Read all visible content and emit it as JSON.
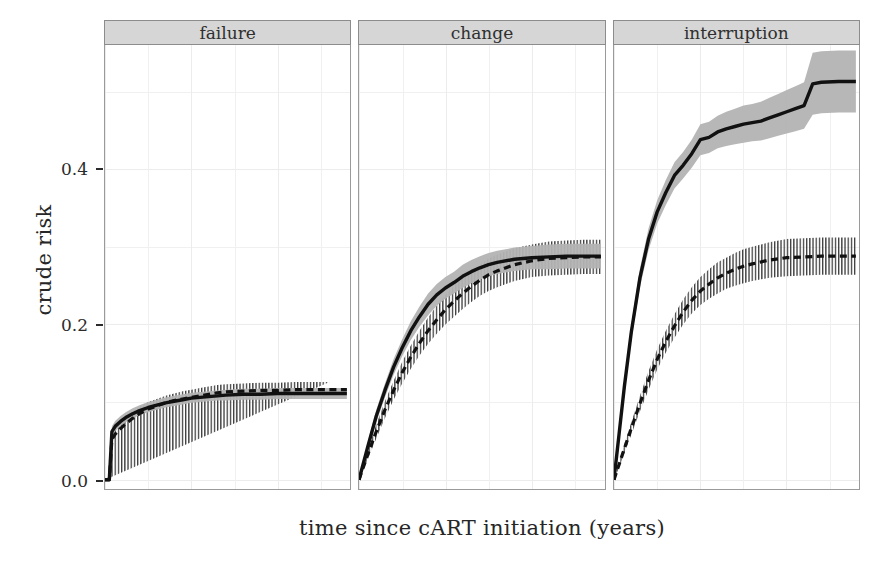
{
  "chart_data": {
    "type": "line",
    "title": "",
    "xlabel": "time since cART initiation (years)",
    "ylabel": "crude risk",
    "xlim": [
      0,
      14.2
    ],
    "ylim": [
      -0.012,
      0.56
    ],
    "xticks": [
      0,
      5,
      10
    ],
    "xticklabels": [
      "0",
      "5",
      "10"
    ],
    "yticks": [
      0.0,
      0.2,
      0.4
    ],
    "yticklabels": [
      "0.0",
      "0.2",
      "0.4"
    ],
    "grid": true,
    "legend": "none",
    "facet_variable": "outcome",
    "facets": [
      "failure",
      "change",
      "interruption"
    ],
    "series": [
      {
        "name": "solid-estimate",
        "style": "solid",
        "facet": "failure",
        "x": [
          0,
          0.25,
          0.4,
          0.6,
          0.9,
          1.2,
          1.6,
          2.0,
          2.5,
          3.0,
          3.5,
          4.0,
          4.5,
          5.0,
          5.5,
          6.0,
          6.5,
          7.0,
          8.0,
          9.0,
          10.0,
          11.0,
          12.0,
          13.0,
          14.0
        ],
        "y": [
          0.0,
          0.0,
          0.062,
          0.069,
          0.075,
          0.08,
          0.085,
          0.089,
          0.093,
          0.096,
          0.099,
          0.101,
          0.103,
          0.105,
          0.106,
          0.107,
          0.108,
          0.109,
          0.11,
          0.11,
          0.111,
          0.111,
          0.111,
          0.111,
          0.111
        ],
        "lower": [
          0.0,
          0.0,
          0.056,
          0.063,
          0.069,
          0.074,
          0.079,
          0.083,
          0.087,
          0.09,
          0.093,
          0.095,
          0.097,
          0.099,
          0.1,
          0.101,
          0.102,
          0.102,
          0.103,
          0.103,
          0.104,
          0.104,
          0.104,
          0.104,
          0.104
        ],
        "upper": [
          0.0,
          0.0,
          0.069,
          0.076,
          0.082,
          0.087,
          0.092,
          0.096,
          0.1,
          0.103,
          0.106,
          0.108,
          0.11,
          0.112,
          0.113,
          0.114,
          0.115,
          0.116,
          0.117,
          0.117,
          0.118,
          0.118,
          0.118,
          0.118,
          0.118
        ]
      },
      {
        "name": "dashed-estimate",
        "style": "dashed",
        "facet": "failure",
        "x": [
          0,
          0.25,
          0.4,
          0.6,
          0.9,
          1.2,
          1.6,
          2.0,
          2.5,
          3.0,
          3.5,
          4.0,
          4.5,
          5.0,
          5.5,
          6.0,
          6.5,
          7.0,
          8.0,
          9.0,
          10.0,
          11.0,
          12.0,
          13.0,
          14.0
        ],
        "y": [
          0.0,
          0.0,
          0.052,
          0.059,
          0.066,
          0.072,
          0.079,
          0.085,
          0.091,
          0.095,
          0.099,
          0.102,
          0.104,
          0.106,
          0.108,
          0.11,
          0.112,
          0.113,
          0.114,
          0.115,
          0.115,
          0.116,
          0.116,
          0.116,
          0.116
        ],
        "lower": [
          0.0,
          0.0,
          0.044,
          0.051,
          0.057,
          0.063,
          0.07,
          0.076,
          0.082,
          0.086,
          0.09,
          0.093,
          0.095,
          0.097,
          0.099,
          0.101,
          0.103,
          0.104,
          0.105,
          0.106,
          0.106,
          0.107,
          0.107,
          0.107,
          0.107
        ],
        "upper": [
          0.0,
          0.0,
          0.061,
          0.068,
          0.075,
          0.081,
          0.088,
          0.094,
          0.1,
          0.104,
          0.108,
          0.111,
          0.114,
          0.116,
          0.118,
          0.12,
          0.122,
          0.123,
          0.124,
          0.125,
          0.125,
          0.126,
          0.126,
          0.126
        ]
      },
      {
        "name": "solid-estimate",
        "style": "solid",
        "facet": "change",
        "x": [
          0,
          0.5,
          1.0,
          1.5,
          2.0,
          2.5,
          3.0,
          3.5,
          4.0,
          4.5,
          5.0,
          5.5,
          6.0,
          6.5,
          7.0,
          7.5,
          8.0,
          9.0,
          10.0,
          11.0,
          12.0,
          13.0,
          14.0
        ],
        "y": [
          0.0,
          0.042,
          0.082,
          0.115,
          0.145,
          0.17,
          0.192,
          0.21,
          0.226,
          0.238,
          0.247,
          0.254,
          0.262,
          0.268,
          0.273,
          0.277,
          0.28,
          0.284,
          0.286,
          0.287,
          0.288,
          0.288,
          0.288
        ],
        "lower": [
          0.0,
          0.036,
          0.074,
          0.106,
          0.135,
          0.159,
          0.18,
          0.197,
          0.212,
          0.224,
          0.233,
          0.24,
          0.247,
          0.253,
          0.258,
          0.262,
          0.265,
          0.269,
          0.271,
          0.271,
          0.272,
          0.272,
          0.272
        ],
        "upper": [
          0.0,
          0.048,
          0.09,
          0.124,
          0.155,
          0.181,
          0.204,
          0.223,
          0.24,
          0.252,
          0.261,
          0.268,
          0.277,
          0.283,
          0.288,
          0.292,
          0.295,
          0.299,
          0.301,
          0.303,
          0.304,
          0.304,
          0.304
        ]
      },
      {
        "name": "dashed-estimate",
        "style": "dashed",
        "facet": "change",
        "x": [
          0,
          0.5,
          1.0,
          1.5,
          2.0,
          2.5,
          3.0,
          3.5,
          4.0,
          4.5,
          5.0,
          5.5,
          6.0,
          6.5,
          7.0,
          7.5,
          8.0,
          9.0,
          10.0,
          11.0,
          12.0,
          13.0,
          14.0
        ],
        "y": [
          0.0,
          0.032,
          0.062,
          0.09,
          0.115,
          0.138,
          0.158,
          0.176,
          0.192,
          0.206,
          0.219,
          0.23,
          0.24,
          0.249,
          0.257,
          0.264,
          0.269,
          0.277,
          0.282,
          0.285,
          0.286,
          0.287,
          0.287
        ],
        "lower": [
          0.0,
          0.026,
          0.053,
          0.079,
          0.103,
          0.124,
          0.143,
          0.16,
          0.175,
          0.188,
          0.2,
          0.21,
          0.22,
          0.229,
          0.237,
          0.243,
          0.248,
          0.256,
          0.261,
          0.263,
          0.264,
          0.265,
          0.265
        ],
        "upper": [
          0.0,
          0.038,
          0.071,
          0.101,
          0.127,
          0.152,
          0.173,
          0.192,
          0.209,
          0.224,
          0.238,
          0.25,
          0.26,
          0.269,
          0.277,
          0.285,
          0.29,
          0.298,
          0.303,
          0.307,
          0.308,
          0.309,
          0.309
        ]
      },
      {
        "name": "solid-estimate",
        "style": "solid",
        "facet": "interruption",
        "x": [
          0,
          0.3,
          0.6,
          1.0,
          1.5,
          2.0,
          2.5,
          3.0,
          3.5,
          4.0,
          4.5,
          5.0,
          5.5,
          6.0,
          6.5,
          7.0,
          7.5,
          8.0,
          8.5,
          9.0,
          9.5,
          10.0,
          10.5,
          11.0,
          11.5,
          12.0,
          13.0,
          14.0
        ],
        "y": [
          0.0,
          0.06,
          0.12,
          0.19,
          0.26,
          0.31,
          0.345,
          0.37,
          0.392,
          0.405,
          0.42,
          0.438,
          0.441,
          0.448,
          0.452,
          0.455,
          0.458,
          0.46,
          0.462,
          0.466,
          0.47,
          0.474,
          0.478,
          0.482,
          0.51,
          0.512,
          0.513,
          0.513
        ],
        "lower": [
          0.0,
          0.054,
          0.112,
          0.18,
          0.248,
          0.296,
          0.33,
          0.354,
          0.375,
          0.388,
          0.402,
          0.418,
          0.421,
          0.427,
          0.43,
          0.432,
          0.434,
          0.436,
          0.437,
          0.44,
          0.443,
          0.446,
          0.449,
          0.452,
          0.47,
          0.472,
          0.473,
          0.473
        ],
        "upper": [
          0.0,
          0.066,
          0.128,
          0.2,
          0.272,
          0.324,
          0.36,
          0.386,
          0.409,
          0.422,
          0.438,
          0.458,
          0.461,
          0.469,
          0.474,
          0.478,
          0.482,
          0.484,
          0.487,
          0.492,
          0.497,
          0.502,
          0.507,
          0.512,
          0.55,
          0.552,
          0.553,
          0.553
        ]
      },
      {
        "name": "dashed-estimate",
        "style": "dashed",
        "facet": "interruption",
        "x": [
          0,
          0.3,
          0.6,
          1.0,
          1.5,
          2.0,
          2.5,
          3.0,
          3.5,
          4.0,
          4.5,
          5.0,
          5.5,
          6.0,
          6.5,
          7.0,
          7.5,
          8.0,
          9.0,
          10.0,
          11.0,
          12.0,
          13.0,
          14.0
        ],
        "y": [
          0.0,
          0.02,
          0.04,
          0.066,
          0.098,
          0.128,
          0.155,
          0.178,
          0.198,
          0.216,
          0.231,
          0.243,
          0.252,
          0.26,
          0.266,
          0.271,
          0.275,
          0.278,
          0.283,
          0.286,
          0.287,
          0.288,
          0.288,
          0.288
        ],
        "lower": [
          0.0,
          0.016,
          0.034,
          0.058,
          0.088,
          0.116,
          0.142,
          0.164,
          0.183,
          0.2,
          0.214,
          0.225,
          0.233,
          0.24,
          0.246,
          0.25,
          0.253,
          0.256,
          0.26,
          0.262,
          0.263,
          0.264,
          0.264,
          0.264
        ],
        "upper": [
          0.0,
          0.024,
          0.046,
          0.074,
          0.108,
          0.14,
          0.168,
          0.192,
          0.213,
          0.232,
          0.248,
          0.261,
          0.271,
          0.28,
          0.286,
          0.292,
          0.297,
          0.3,
          0.306,
          0.31,
          0.311,
          0.312,
          0.312,
          0.312
        ]
      }
    ],
    "colors": {
      "line": "#111111",
      "band_solid": "#b3b3b3",
      "band_dashed_hatch": "#3a3a3a",
      "strip_fill": "#d6d6d6",
      "strip_border": "#8c8c8c",
      "grid": "#f0f0f0",
      "panel_border": "#9a9a9a",
      "text": "#262626"
    }
  },
  "axes": {
    "ylabel": "crude risk",
    "xlabel": "time since cART initiation (years)",
    "yticklabels": [
      "0.4",
      "0.2",
      "0.0"
    ],
    "xticklabels": [
      "0",
      "5",
      "10"
    ]
  },
  "panels": [
    {
      "label": "failure"
    },
    {
      "label": "change"
    },
    {
      "label": "interruption"
    }
  ]
}
